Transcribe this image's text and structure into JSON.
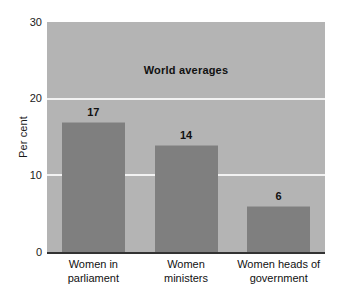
{
  "chart_data": {
    "type": "bar",
    "title": "",
    "subtitle": "",
    "annotation": "World averages",
    "categories": [
      "Women in parliament",
      "Women ministers",
      "Women heads of government"
    ],
    "category_lines": [
      [
        "Women in",
        "parliament"
      ],
      [
        "Women",
        "ministers"
      ],
      [
        "Women heads of",
        "government"
      ]
    ],
    "values": [
      17,
      14,
      6
    ],
    "value_labels": [
      "17",
      "14",
      "6"
    ],
    "xlabel": "",
    "ylabel": "Per cent",
    "ylim": [
      0,
      30
    ],
    "yticks": [
      0,
      10,
      20,
      30
    ],
    "ytick_labels": [
      "0",
      "10",
      "20",
      "30"
    ],
    "grid": true,
    "gridlines_at": [
      10,
      20
    ],
    "legend": false,
    "colors": {
      "bar": "#7f7f7f",
      "plot_background": "#b4b4b4",
      "gridline": "#f2f2f2",
      "axis": "#333333",
      "text": "#111111",
      "page_background": "#ffffff"
    }
  }
}
